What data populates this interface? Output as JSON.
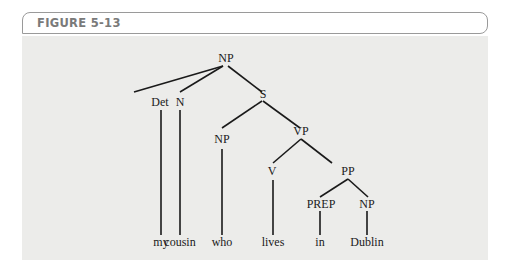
{
  "figure": {
    "label": "FIGURE 5-13"
  },
  "tree": {
    "nodes": {
      "root_np": "NP",
      "det": "Det",
      "n": "N",
      "s": "S",
      "np_who": "NP",
      "vp": "VP",
      "v": "V",
      "pp": "PP",
      "prep": "PREP",
      "np_dublin": "NP"
    },
    "words": {
      "my": "my",
      "cousin": "cousin",
      "who": "who",
      "lives": "lives",
      "in": "in",
      "dublin": "Dublin"
    }
  },
  "colors": {
    "panel_bg": "#ececea",
    "label_gray": "#7a7a7a",
    "line": "#1a1a1a"
  }
}
